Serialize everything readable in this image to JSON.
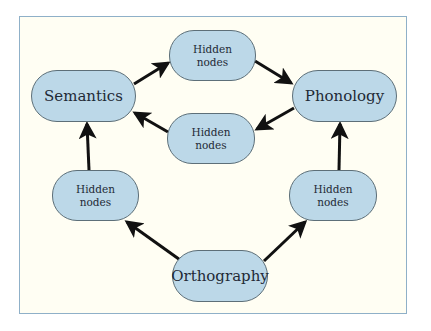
{
  "diagram": {
    "type": "connectionist-reading-model",
    "colors": {
      "background": "#fffef3",
      "frame_border": "#8fb0c8",
      "node_fill": "#bcd8e8",
      "node_border": "#5d6f78",
      "arrow": "#111111",
      "text": "#1f2a36"
    },
    "nodes": {
      "semantics": {
        "label": "Semantics"
      },
      "phonology": {
        "label": "Phonology"
      },
      "orthography": {
        "label": "Orthography"
      },
      "hidden_top": {
        "label": "Hidden\nnodes"
      },
      "hidden_middle": {
        "label": "Hidden\nnodes"
      },
      "hidden_left": {
        "label": "Hidden\nnodes"
      },
      "hidden_right": {
        "label": "Hidden\nnodes"
      }
    },
    "edges": [
      {
        "from": "semantics",
        "to": "hidden_top"
      },
      {
        "from": "hidden_top",
        "to": "phonology"
      },
      {
        "from": "phonology",
        "to": "hidden_middle"
      },
      {
        "from": "hidden_middle",
        "to": "semantics"
      },
      {
        "from": "orthography",
        "to": "hidden_left"
      },
      {
        "from": "hidden_left",
        "to": "semantics"
      },
      {
        "from": "orthography",
        "to": "hidden_right"
      },
      {
        "from": "hidden_right",
        "to": "phonology"
      }
    ]
  }
}
